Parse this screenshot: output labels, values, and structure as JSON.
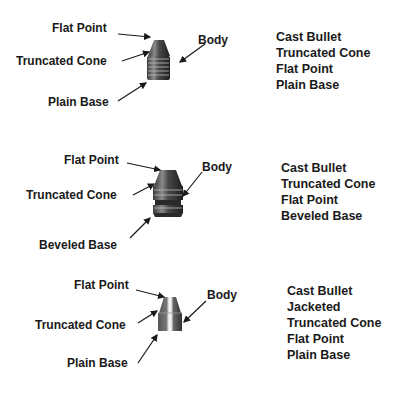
{
  "diagrams": [
    {
      "labels": {
        "flat_point": "Flat Point",
        "truncated_cone": "Truncated Cone",
        "body": "Body",
        "base": "Plain Base"
      },
      "description": [
        "Cast Bullet",
        "Truncated Cone",
        "Flat Point",
        "Plain Base"
      ]
    },
    {
      "labels": {
        "flat_point": "Flat Point",
        "truncated_cone": "Truncated Cone",
        "body": "Body",
        "base": "Beveled Base"
      },
      "description": [
        "Cast Bullet",
        "Truncated Cone",
        "Flat Point",
        "Beveled Base"
      ]
    },
    {
      "labels": {
        "flat_point": "Flat Point",
        "truncated_cone": "Truncated Cone",
        "body": "Body",
        "base": "Plain Base"
      },
      "description": [
        "Cast Bullet",
        "Jacketed",
        "Truncated Cone",
        "Flat Point",
        "Plain Base"
      ]
    }
  ],
  "colors": {
    "text": "#1a1a1a",
    "bullet_dark": "#2e2e2e",
    "bullet_mid": "#6a6a6a",
    "bullet_light": "#cfcfcf",
    "background": "#ffffff"
  }
}
